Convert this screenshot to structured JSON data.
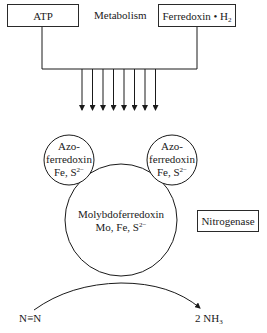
{
  "diagram": {
    "title": "Nitrogenase",
    "inputs": {
      "atp": "ATP",
      "metabolism": "Metabolism",
      "ferredoxin": {
        "text": "Ferredoxin • H",
        "subscript": "2"
      }
    },
    "arrows": {
      "count": 8,
      "x": [
        82,
        92.5,
        103,
        113.5,
        124,
        134.5,
        145,
        155.5
      ]
    },
    "azoferredoxin_left": {
      "line1": "Azo-",
      "line2": "ferredoxin",
      "line3": "Fe, S",
      "superscript": "2−"
    },
    "azoferredoxin_right": {
      "line1": "Azo-",
      "line2": "ferredoxin",
      "line3": "Fe, S",
      "superscript": "2−"
    },
    "molybdoferredoxin": {
      "line1": "Molybdoferredoxin",
      "line2": "Mo, Fe, S",
      "superscript": "2−"
    },
    "enzyme_label": "Nitrogenase",
    "substrate": "N≡N",
    "product": {
      "prefix": "2 NH",
      "subscript": "3"
    }
  }
}
